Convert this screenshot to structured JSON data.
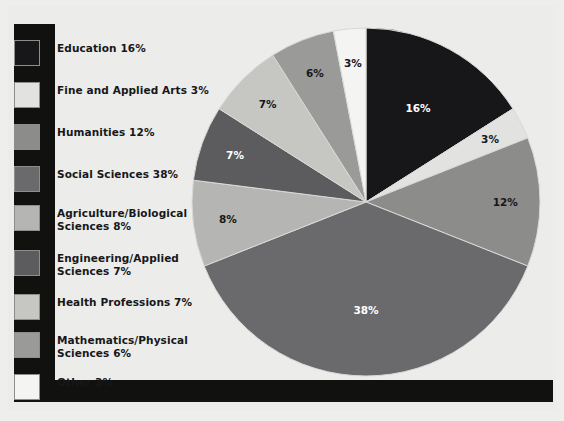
{
  "figure": {
    "background_color": "#ececea",
    "frame_color": "#111110"
  },
  "legend": {
    "items": [
      {
        "label": "Education 16%",
        "color": "#17171a",
        "label_color": "#17171a"
      },
      {
        "label": "Fine and Applied Arts 3%",
        "color": "#e2e2e0",
        "label_color": "#17171a"
      },
      {
        "label": "Humanities 12%",
        "color": "#8c8c8a",
        "label_color": "#17171a"
      },
      {
        "label": "Social Sciences 38%",
        "color": "#6a6a6c",
        "label_color": "#17171a"
      },
      {
        "label": "Agriculture/Biological\nSciences 8%",
        "color": "#b5b5b3",
        "label_color": "#17171a"
      },
      {
        "label": "Engineering/Applied\nSciences 7%",
        "color": "#5c5c5e",
        "label_color": "#17171a"
      },
      {
        "label": "Health Professions 7%",
        "color": "#c6c6c3",
        "label_color": "#17171a"
      },
      {
        "label": "Mathematics/Physical\nSciences 6%",
        "color": "#9a9a98",
        "label_color": "#17171a"
      },
      {
        "label": "Other 3%",
        "color": "#f4f4f2",
        "label_color": "#17171a"
      }
    ]
  },
  "chart_data": {
    "type": "pie",
    "title": "",
    "xlabel": "",
    "ylabel": "",
    "start_angle_deg": 0,
    "direction": "clockwise",
    "legend_position": "left",
    "grid": false,
    "categories": [
      "Education",
      "Fine and Applied Arts",
      "Humanities",
      "Social Sciences",
      "Agriculture/Biological Sciences",
      "Engineering/Applied Sciences",
      "Health Professions",
      "Mathematics/Physical Sciences",
      "Other"
    ],
    "values": [
      16,
      3,
      12,
      38,
      8,
      7,
      7,
      6,
      3
    ],
    "data_labels": [
      "16%",
      "3%",
      "12%",
      "38%",
      "8%",
      "7%",
      "7%",
      "6%",
      "3%"
    ],
    "colors": [
      "#17171a",
      "#e2e2e0",
      "#8c8c8a",
      "#6a6a6c",
      "#b5b5b3",
      "#5c5c5e",
      "#c6c6c3",
      "#9a9a98",
      "#f4f4f2"
    ],
    "label_text_colors": [
      "#ffffff",
      "#17171a",
      "#17171a",
      "#ffffff",
      "#17171a",
      "#ffffff",
      "#17171a",
      "#17171a",
      "#17171a"
    ],
    "label_radius_fraction": [
      0.62,
      0.8,
      0.8,
      0.62,
      0.8,
      0.8,
      0.8,
      0.8,
      0.8
    ],
    "units": "percent",
    "total": 100
  }
}
